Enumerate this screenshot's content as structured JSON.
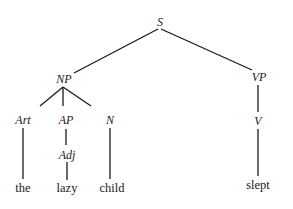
{
  "diagram": {
    "type": "syntax-tree",
    "nodes": {
      "S": {
        "label": "S"
      },
      "NP": {
        "label": "NP"
      },
      "VP": {
        "label": "VP"
      },
      "Art": {
        "label": "Art"
      },
      "AP": {
        "label": "AP"
      },
      "Adj": {
        "label": "Adj"
      },
      "N": {
        "label": "N"
      },
      "V": {
        "label": "V"
      }
    },
    "words": {
      "the": "the",
      "lazy": "lazy",
      "child": "child",
      "slept": "slept"
    },
    "edges": [
      [
        "S",
        "NP"
      ],
      [
        "S",
        "VP"
      ],
      [
        "NP",
        "Art"
      ],
      [
        "NP",
        "AP"
      ],
      [
        "NP",
        "N"
      ],
      [
        "AP",
        "Adj"
      ],
      [
        "VP",
        "V"
      ],
      [
        "Art",
        "the"
      ],
      [
        "Adj",
        "lazy"
      ],
      [
        "N",
        "child"
      ],
      [
        "V",
        "slept"
      ]
    ]
  }
}
